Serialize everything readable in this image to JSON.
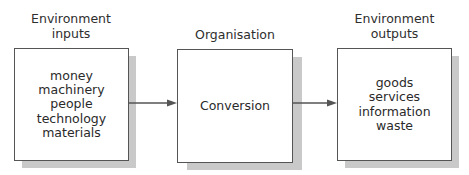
{
  "diagram": {
    "type": "flow",
    "direction": "left-to-right",
    "colors": {
      "border": "#555555",
      "shadow": "#c9c9c9",
      "text": "#2a2a2a",
      "arrow": "#555555"
    },
    "nodes": [
      {
        "id": "inputs",
        "title_lines": [
          "Environment",
          "inputs"
        ],
        "items": [
          "money",
          "machinery",
          "people",
          "technology",
          "materials"
        ]
      },
      {
        "id": "organisation",
        "title_lines": [
          "Organisation"
        ],
        "items": [
          "Conversion"
        ]
      },
      {
        "id": "outputs",
        "title_lines": [
          "Environment",
          "outputs"
        ],
        "items": [
          "goods",
          "services",
          "information",
          "waste"
        ]
      }
    ],
    "edges": [
      {
        "from": "inputs",
        "to": "organisation"
      },
      {
        "from": "organisation",
        "to": "outputs"
      }
    ]
  }
}
